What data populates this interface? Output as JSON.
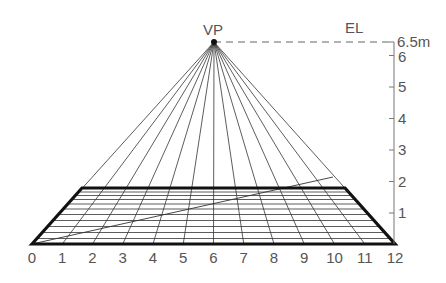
{
  "diagram": {
    "title_labels": {
      "vanishing_point": "VP",
      "eye_level": "EL",
      "height_max": "6.5m"
    },
    "x_axis": {
      "ticks": [
        "0",
        "1",
        "2",
        "3",
        "4",
        "5",
        "6",
        "7",
        "8",
        "9",
        "10",
        "11",
        "12"
      ]
    },
    "y_axis": {
      "ticks": [
        "1",
        "2",
        "3",
        "4",
        "5",
        "6"
      ],
      "top_label": "6.5m"
    },
    "colors": {
      "line": "#222222",
      "thick": "#111111",
      "label": "#555555",
      "axis": "#777777"
    }
  }
}
